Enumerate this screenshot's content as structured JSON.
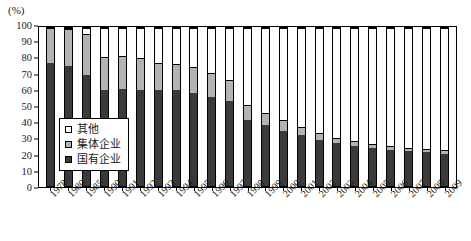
{
  "chart_data": {
    "type": "bar",
    "stacked": true,
    "title": "",
    "xlabel": "",
    "ylabel": "(%)",
    "ylim": [
      0,
      100
    ],
    "yticks": [
      0,
      10,
      20,
      30,
      40,
      50,
      60,
      70,
      80,
      90,
      100
    ],
    "grid": false,
    "legend_position": "inside-left",
    "categories": [
      "1978",
      "1980",
      "1985",
      "1990",
      "1991",
      "1992",
      "1993",
      "1994",
      "1995",
      "1996",
      "1997",
      "1998",
      "1999",
      "2000",
      "2001",
      "2002",
      "2003",
      "2004",
      "2005",
      "2006",
      "2007",
      "2008",
      "2009"
    ],
    "series": [
      {
        "name": "国有企业",
        "color": "#3a3a3a",
        "values": [
          78,
          76,
          70,
          61,
          61.5,
          61,
          60.5,
          60.5,
          59,
          56.5,
          53.5,
          42,
          38.5,
          35,
          32,
          29,
          27,
          25.5,
          24,
          23,
          22,
          21.5,
          20.5
        ]
      },
      {
        "name": "集体企业",
        "color": "#b3b3b3",
        "values": [
          22,
          23.5,
          26,
          20.5,
          20.5,
          20,
          17.5,
          17,
          16.5,
          15,
          13.5,
          9,
          7.5,
          6.5,
          5.5,
          4.5,
          3.5,
          3,
          2.5,
          2.5,
          2,
          2,
          2
        ]
      },
      {
        "name": "其他",
        "color": "#ffffff",
        "values": [
          0,
          0.5,
          4,
          18.5,
          18,
          19,
          22,
          22.5,
          24.5,
          28.5,
          33,
          49,
          54,
          58.5,
          62.5,
          66.5,
          69.5,
          71.5,
          73.5,
          74.5,
          76,
          76.5,
          77.5
        ]
      }
    ],
    "stack_tops": {
      "state": [
        78,
        76,
        70,
        61,
        61.5,
        61,
        60.5,
        60.5,
        59,
        56.5,
        53.5,
        42,
        38.5,
        35,
        32,
        29,
        27,
        25.5,
        24,
        23,
        22,
        21.5,
        20.5
      ],
      "collective": [
        100,
        99.5,
        96,
        81.5,
        82,
        81,
        78,
        77.5,
        75.5,
        71.5,
        67,
        51,
        46,
        41.5,
        37.5,
        33.5,
        30.5,
        28.5,
        26.5,
        25.5,
        24,
        23.5,
        22.5
      ]
    }
  },
  "legend": {
    "items": [
      {
        "label": "其他",
        "swatch": "white-square-icon"
      },
      {
        "label": "集体企业",
        "swatch": "gray-square-icon"
      },
      {
        "label": "国有企业",
        "swatch": "dark-square-icon"
      }
    ]
  },
  "axis": {
    "unit": "(%)"
  }
}
